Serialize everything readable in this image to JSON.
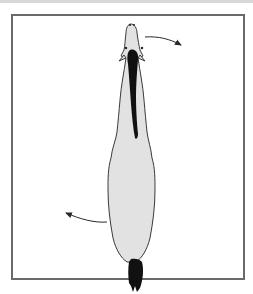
{
  "figure": {
    "colors": {
      "frame": "#6a6a6a",
      "body_fill": "#e2e2e2",
      "outline": "#3a3a3a",
      "mane": "#111111",
      "tail": "#111111",
      "arrow": "#2a2a2a",
      "background": "#ffffff"
    },
    "arrows": [
      {
        "name": "head-rotation-arrow",
        "direction": "right",
        "location": "head"
      },
      {
        "name": "hindquarter-rotation-arrow",
        "direction": "left",
        "location": "hindquarters"
      }
    ]
  }
}
